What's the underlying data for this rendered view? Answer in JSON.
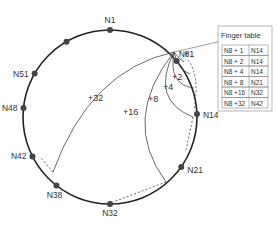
{
  "nodes": [
    {
      "label": "N1",
      "angle": 0
    },
    {
      "label": "N8",
      "angle": 50
    },
    {
      "label": "N14",
      "angle": 88
    },
    {
      "label": "N21",
      "angle": 125
    },
    {
      "label": "N32",
      "angle": 180
    },
    {
      "label": "N38",
      "angle": 218
    },
    {
      "label": "N42",
      "angle": 243
    },
    {
      "label": "N48",
      "angle": 276
    },
    {
      "label": "N51",
      "angle": 300
    },
    {
      "label": "",
      "angle": 330
    }
  ],
  "fingers": [
    {
      "label": "+1"
    },
    {
      "label": "+2"
    },
    {
      "label": "+4"
    },
    {
      "label": "+8"
    },
    {
      "label": "+16"
    },
    {
      "label": "+32"
    }
  ],
  "finger_table": {
    "title": "Finger table",
    "rows": [
      [
        "N8 + 1",
        "N14"
      ],
      [
        "N8 + 2",
        "N14"
      ],
      [
        "N8 + 4",
        "N14"
      ],
      [
        "N8 + 8",
        "N21"
      ],
      [
        "N8 +16",
        "N32"
      ],
      [
        "N8 +32",
        "N42"
      ]
    ]
  }
}
